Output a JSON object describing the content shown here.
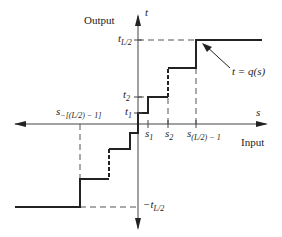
{
  "diagram": {
    "axes": {
      "vertical_label": "Output",
      "vertical_var": "t",
      "horizontal_label": "Input",
      "horizontal_var": "s"
    },
    "y_ticks": {
      "t_half": "t",
      "t_half_sub": "L/2",
      "t2": "t",
      "t2_sub": "2",
      "t1": "t",
      "t1_sub": "1",
      "neg_t_half": "−t",
      "neg_t_half_sub": "L/2"
    },
    "x_ticks": {
      "s1": "s",
      "s1_sub": "1",
      "s2": "s",
      "s2_sub": "2",
      "s_last": "s",
      "s_last_sub": "(L/2) − 1",
      "s_neg_last": "s",
      "s_neg_last_sub": "−[(L/2) − 1]"
    },
    "annotation": "t = q(s)",
    "colors": {
      "line": "#222222",
      "axis": "#444444",
      "dashed": "#555555"
    }
  }
}
